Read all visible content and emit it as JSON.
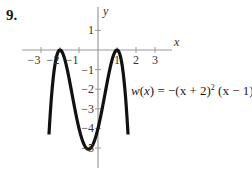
{
  "problem": {
    "number": "9."
  },
  "chart_data": {
    "type": "line",
    "title": "",
    "function_label": "w(x) = −(x + 2)² (x − 1)²",
    "function_parts": {
      "name": "w",
      "var": "x",
      "expr_before": "= −(",
      "term1": "x + 2)",
      "exp1": "2",
      "term2": "(x − 1)",
      "exp2": "2"
    },
    "xlabel": "x",
    "ylabel": "y",
    "x_ticks": [
      -3,
      -2,
      -1,
      1,
      2,
      3
    ],
    "y_ticks": [
      1,
      -1,
      -2,
      -3,
      -4,
      -5
    ],
    "xlim": [
      -4,
      4
    ],
    "ylim": [
      -6,
      2
    ],
    "grid": false,
    "series": [
      {
        "name": "w(x)",
        "color": "#111111",
        "x": [
          -2.58,
          -2.5,
          -2.25,
          -2,
          -1.75,
          -1.5,
          -1.25,
          -1,
          -0.75,
          -0.5,
          -0.25,
          0,
          0.25,
          0.5,
          0.75,
          1,
          1.25,
          1.5,
          1.58
        ],
        "y": [
          -5.98,
          -5.06,
          -0.77,
          0,
          -0.48,
          -1.56,
          -2.85,
          -4,
          -4.77,
          -5.06,
          -4.77,
          -4,
          -2.85,
          -1.56,
          -0.48,
          0,
          -0.77,
          -3.06,
          -5.98
        ]
      }
    ],
    "key_points": [
      {
        "x": -2,
        "y": 0,
        "label": "local max"
      },
      {
        "x": 1,
        "y": 0,
        "label": "local max"
      },
      {
        "x": -0.5,
        "y": -5.0625,
        "label": "local min"
      }
    ]
  },
  "colors": {
    "axis": "#9a9a9a",
    "curve": "#111111",
    "text": "#333333"
  }
}
